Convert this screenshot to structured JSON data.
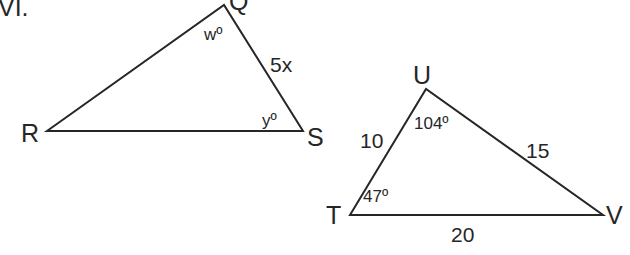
{
  "problem_number": "VI.",
  "triangle_qrs": {
    "vertices": {
      "Q": "Q",
      "R": "R",
      "S": "S"
    },
    "angle_Q": "wº",
    "angle_S": "yº",
    "side_QS": "5x"
  },
  "triangle_tuv": {
    "vertices": {
      "T": "T",
      "U": "U",
      "V": "V"
    },
    "angle_U": "104º",
    "angle_T": "47º",
    "side_TU": "10",
    "side_UV": "15",
    "side_TV": "20"
  }
}
